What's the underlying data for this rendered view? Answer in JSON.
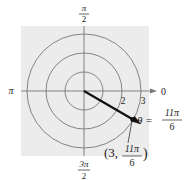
{
  "diagram": {
    "type": "polar-coordinate-plot",
    "background_color": "#ececec",
    "line_color": "#777777",
    "vector_color": "#111111",
    "circles": [
      {
        "radius_units": 1
      },
      {
        "radius_units": 2
      },
      {
        "radius_units": 3
      }
    ],
    "axis_labels": {
      "top": {
        "num": "π",
        "den": "2"
      },
      "left": "π",
      "right": "0",
      "bottom": {
        "num": "3π",
        "den": "2"
      }
    },
    "radius_labels": [
      "2",
      "3"
    ],
    "angle_label": {
      "lhs": "θ =",
      "num": "11π",
      "den": "6"
    },
    "point": {
      "r": 3,
      "theta": "11π/6",
      "label_prefix": "(3,",
      "label_num": "11π",
      "label_den": "6",
      "label_suffix": ")"
    }
  }
}
